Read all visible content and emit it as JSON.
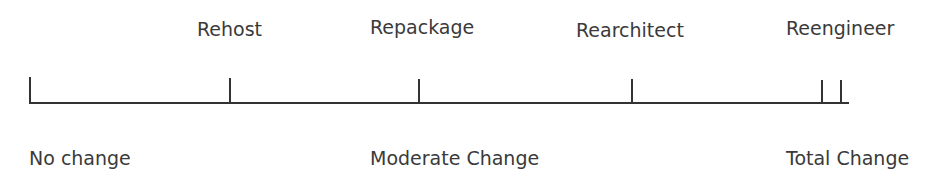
{
  "diagram": {
    "title": "",
    "approaches": [
      {
        "label": "Rehost"
      },
      {
        "label": "Repackage"
      },
      {
        "label": "Rearchitect"
      },
      {
        "label": "Reengineer"
      }
    ],
    "scale_labels": {
      "left": "No change",
      "middle": "Moderate Change",
      "right": "Total Change"
    },
    "line_color": "#333333"
  }
}
